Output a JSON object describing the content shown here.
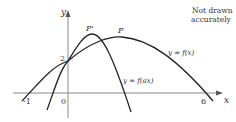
{
  "note": {
    "line1": "Not drawn",
    "line2": "accurately"
  },
  "axes": {
    "x_label": "x",
    "y_label": "y",
    "origin_label": "0",
    "x_ticks": [
      "-1",
      "6"
    ],
    "y_ticks": [
      "2"
    ]
  },
  "curves": [
    {
      "name": "f",
      "label": "y = f(x)",
      "peak_label": "P",
      "roots": [
        -1,
        6
      ],
      "y_intercept": 2
    },
    {
      "name": "f_ax",
      "label": "y = f(ax)",
      "peak_label": "P'",
      "y_intercept": 2
    }
  ],
  "colors": {
    "curve": "#222222",
    "axis": "#888888",
    "text": "#333333"
  }
}
